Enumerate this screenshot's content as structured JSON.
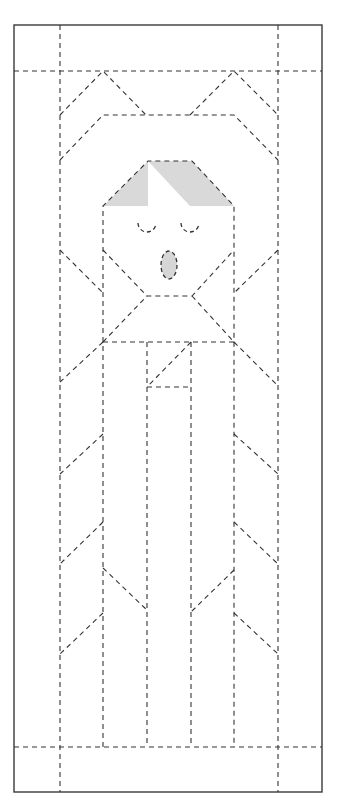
{
  "diagram": {
    "title": "Folding template - figure with face",
    "canvas": {
      "width": 341,
      "height": 803,
      "background": "#ffffff"
    },
    "colors": {
      "line": "#333333",
      "border": "#3a3a3a",
      "shade": "#d9d9d9",
      "mouth_fill": "#d6d6d6"
    },
    "border": {
      "x": 14,
      "y": 25,
      "width": 308,
      "height": 767
    },
    "fold_lines": [
      {
        "id": "top-horizontal",
        "points": [
          [
            14,
            71
          ],
          [
            322,
            71
          ]
        ]
      },
      {
        "id": "bottom-horizontal",
        "points": [
          [
            14,
            747
          ],
          [
            322,
            747
          ]
        ]
      },
      {
        "id": "outer-left-vertical",
        "points": [
          [
            60,
            25
          ],
          [
            60,
            792
          ]
        ]
      },
      {
        "id": "outer-right-vertical",
        "points": [
          [
            278,
            25
          ],
          [
            278,
            792
          ]
        ]
      },
      {
        "id": "top-left-peak",
        "points": [
          [
            60,
            115
          ],
          [
            103,
            71
          ],
          [
            146,
            115
          ]
        ]
      },
      {
        "id": "top-right-peak",
        "points": [
          [
            190,
            115
          ],
          [
            234,
            71
          ],
          [
            278,
            115
          ]
        ]
      },
      {
        "id": "hair-band",
        "points": [
          [
            60,
            160
          ],
          [
            103,
            115
          ],
          [
            234,
            115
          ],
          [
            278,
            160
          ]
        ]
      },
      {
        "id": "head-outline",
        "points": [
          [
            103,
            747
          ],
          [
            103,
            206
          ],
          [
            148,
            161
          ],
          [
            192,
            161
          ],
          [
            234,
            206
          ],
          [
            234,
            747
          ]
        ]
      },
      {
        "id": "chin",
        "points": [
          [
            103,
            250
          ],
          [
            147,
            296
          ],
          [
            192,
            296
          ],
          [
            234,
            250
          ]
        ]
      },
      {
        "id": "outer-left-neck",
        "points": [
          [
            60,
            250
          ],
          [
            103,
            293
          ]
        ]
      },
      {
        "id": "outer-right-neck",
        "points": [
          [
            278,
            250
          ],
          [
            234,
            293
          ]
        ]
      },
      {
        "id": "collar",
        "points": [
          [
            103,
            342
          ],
          [
            147,
            296
          ]
        ]
      },
      {
        "id": "collar-right",
        "points": [
          [
            192,
            296
          ],
          [
            234,
            342
          ]
        ]
      },
      {
        "id": "shoulder-line",
        "points": [
          [
            103,
            342
          ],
          [
            234,
            342
          ]
        ]
      },
      {
        "id": "shoulder-left",
        "points": [
          [
            103,
            342
          ],
          [
            60,
            382
          ]
        ]
      },
      {
        "id": "shoulder-right",
        "points": [
          [
            234,
            342
          ],
          [
            278,
            386
          ]
        ]
      },
      {
        "id": "inner-left-vertical",
        "points": [
          [
            147,
            342
          ],
          [
            147,
            743
          ]
        ]
      },
      {
        "id": "inner-right-vertical",
        "points": [
          [
            191,
            342
          ],
          [
            191,
            747
          ]
        ]
      },
      {
        "id": "lapel-diagonal",
        "points": [
          [
            191,
            342
          ],
          [
            147,
            387
          ]
        ]
      },
      {
        "id": "lapel-horizontal",
        "points": [
          [
            147,
            387
          ],
          [
            190,
            387
          ]
        ]
      },
      {
        "id": "sleeve-left-1",
        "points": [
          [
            103,
            434
          ],
          [
            60,
            474
          ]
        ]
      },
      {
        "id": "sleeve-left-2",
        "points": [
          [
            103,
            522
          ],
          [
            60,
            564
          ]
        ]
      },
      {
        "id": "sleeve-left-3",
        "points": [
          [
            103,
            613
          ],
          [
            60,
            654
          ]
        ]
      },
      {
        "id": "sleeve-right-1",
        "points": [
          [
            234,
            434
          ],
          [
            278,
            474
          ]
        ]
      },
      {
        "id": "sleeve-right-2",
        "points": [
          [
            234,
            522
          ],
          [
            278,
            564
          ]
        ]
      },
      {
        "id": "sleeve-right-3",
        "points": [
          [
            234,
            613
          ],
          [
            278,
            654
          ]
        ]
      },
      {
        "id": "skirt-left",
        "points": [
          [
            103,
            568
          ],
          [
            147,
            610
          ]
        ]
      },
      {
        "id": "skirt-right",
        "points": [
          [
            234,
            570
          ],
          [
            191,
            612
          ]
        ]
      }
    ],
    "shaded_regions": [
      {
        "id": "hair-left",
        "points": [
          [
            103,
            206
          ],
          [
            148,
            161
          ],
          [
            148,
            206
          ]
        ]
      },
      {
        "id": "hair-right",
        "points": [
          [
            148,
            161
          ],
          [
            192,
            161
          ],
          [
            234,
            206
          ],
          [
            190,
            206
          ]
        ]
      }
    ],
    "face": {
      "left_eye": {
        "cx": 147,
        "cy": 226,
        "r": 9
      },
      "right_eye": {
        "cx": 190,
        "cy": 226,
        "r": 9
      },
      "mouth": {
        "cx": 169,
        "cy": 265,
        "rx": 8,
        "ry": 14
      }
    }
  }
}
